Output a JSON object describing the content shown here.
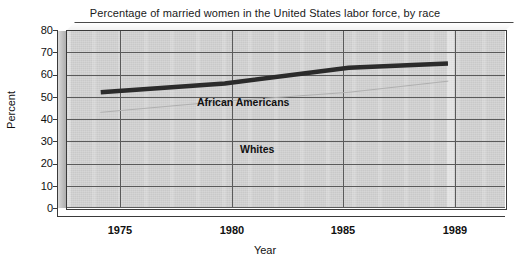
{
  "chart_data": {
    "type": "line",
    "title": "Percentage of married women in the United States labor force, by race",
    "xlabel": "Year",
    "ylabel": "Percent",
    "x": [
      1975,
      1980,
      1985,
      1989
    ],
    "xticklabels": [
      "1975",
      "1980",
      "1985",
      "1989"
    ],
    "yticklabels": [
      "0",
      "10",
      "20",
      "30",
      "40",
      "50",
      "60",
      "70",
      "80"
    ],
    "yticks": [
      0,
      10,
      20,
      30,
      40,
      50,
      60,
      70,
      80
    ],
    "ylim": [
      0,
      80
    ],
    "xlim": [
      1973.6,
      1991.3
    ],
    "grid": "horizontal-and-vertical",
    "legend": "inline-labels",
    "series": [
      {
        "name": "African Americans",
        "values": [
          52,
          56,
          63,
          65
        ],
        "color": "#2b2b2b",
        "linewidth": 4.5,
        "style": "solid-bold"
      },
      {
        "name": "Whites",
        "values": [
          43,
          48,
          52,
          57
        ],
        "color": "#b0b0b0",
        "linewidth": 1,
        "style": "faint"
      }
    ],
    "annotations": [
      {
        "text": "African Americans",
        "series": "African Americans"
      },
      {
        "text": "Whites",
        "series": "Whites"
      }
    ],
    "colors": {
      "plot_background": "#c9c9c9",
      "page_background": "#ffffff",
      "gridline": "#5a5a5a",
      "axis": "#3a3a3a",
      "african_americans_line": "#2b2b2b",
      "whites_line": "#b0b0b0"
    }
  }
}
